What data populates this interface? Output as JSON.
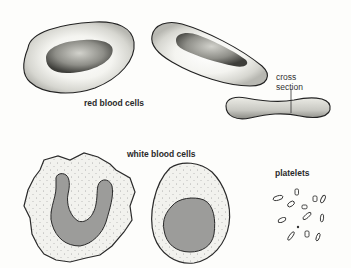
{
  "labels": {
    "red_blood_cells": "red blood cells",
    "cross_section_line1": "cross",
    "cross_section_line2": "section",
    "white_blood_cells": "white blood cells",
    "platelets": "platelets"
  },
  "colors": {
    "background": "#fdfdfb",
    "outline": "#222222",
    "nucleus_gray": "#9c9c9a",
    "stipple": "#555555"
  },
  "figures": [
    {
      "id": "rbc-top-view",
      "type": "red blood cell",
      "view": "top"
    },
    {
      "id": "rbc-tilted-view",
      "type": "red blood cell",
      "view": "tilted"
    },
    {
      "id": "rbc-cross-section",
      "type": "red blood cell",
      "view": "cross section"
    },
    {
      "id": "wbc-lobed-nucleus",
      "type": "white blood cell",
      "nucleus": "U-shaped lobed"
    },
    {
      "id": "wbc-round-nucleus",
      "type": "white blood cell",
      "nucleus": "round"
    },
    {
      "id": "platelet-cluster",
      "type": "platelets",
      "count": 14
    }
  ]
}
